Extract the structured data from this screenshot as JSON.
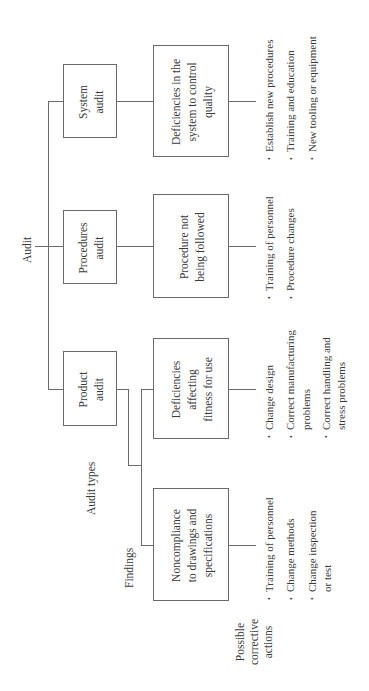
{
  "diagram": {
    "root": "Audit",
    "row_labels": {
      "audit_types": "Audit types",
      "findings": "Findings",
      "corrective_actions": [
        "Possible",
        "corrective",
        "actions"
      ]
    },
    "audit_types": [
      {
        "name": [
          "System",
          "audit"
        ],
        "finding": [
          "Deficiencies in the",
          "system to control",
          "quality"
        ],
        "actions": [
          [
            "Establish new procedures"
          ],
          [
            "Training and education"
          ],
          [
            "New tooling or equipment"
          ]
        ]
      },
      {
        "name": [
          "Procedures",
          "audit"
        ],
        "finding": [
          "Procedure not",
          "being followed"
        ],
        "actions": [
          [
            "Training of personnel"
          ],
          [
            "Procedure changes"
          ]
        ]
      },
      {
        "name": [
          "Product",
          "audit"
        ],
        "findings": [
          {
            "finding": [
              "Deficiencies",
              "affecting",
              "fitness for use"
            ],
            "actions": [
              [
                "Change design"
              ],
              [
                "Correct manufacturing",
                "problems"
              ],
              [
                "Correct handling and",
                "stress problems"
              ]
            ]
          },
          {
            "finding": [
              "Noncompliance",
              "to drawings and",
              "specifications"
            ],
            "actions": [
              [
                "Training of personnel"
              ],
              [
                "Change methods"
              ],
              [
                "Change inspection",
                "or test"
              ]
            ]
          }
        ]
      }
    ],
    "bullet_glyph": "•"
  }
}
